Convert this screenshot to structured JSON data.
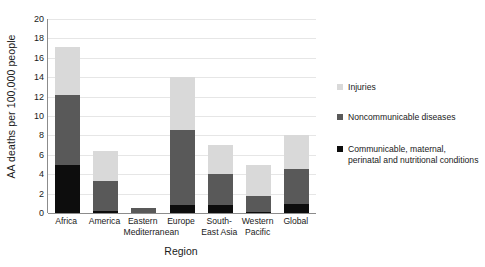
{
  "chart_data": {
    "type": "bar",
    "subtype": "stacked-bar",
    "title": "",
    "xlabel": "Region",
    "ylabel": "AA deaths per 100,000 people",
    "categories": [
      "Africa",
      "America",
      "Eastern Mediterranean",
      "Europe",
      "South-East Asia",
      "Western Pacific",
      "Global"
    ],
    "series": [
      {
        "name": "Communicable, maternal, perinatal and nutritional conditions",
        "color": "#0d0d0d",
        "values": [
          4.9,
          0.2,
          0.0,
          0.85,
          0.8,
          0.15,
          0.9
        ]
      },
      {
        "name": "Noncommunicable diseases",
        "color": "#595959",
        "values": [
          7.3,
          3.1,
          0.5,
          7.75,
          3.25,
          1.6,
          3.6
        ]
      },
      {
        "name": "Injuries",
        "color": "#d9d9d9",
        "values": [
          4.9,
          3.1,
          0.0,
          5.4,
          2.95,
          3.25,
          3.5
        ]
      }
    ],
    "totals": [
      17.1,
      6.4,
      0.5,
      14.0,
      7.0,
      5.0,
      8.0
    ],
    "ylim": [
      0,
      20
    ],
    "yticks": [
      0,
      2,
      4,
      6,
      8,
      10,
      12,
      14,
      16,
      18,
      20
    ],
    "ytick_labels": [
      "0",
      "2",
      "4",
      "6",
      "8",
      "10",
      "12",
      "14",
      "16",
      "18",
      "20"
    ],
    "grid": "horizontal",
    "legend_position": "right",
    "legend": [
      {
        "label": "Injuries",
        "color": "#d9d9d9"
      },
      {
        "label": "Noncommunicable diseases",
        "color": "#595959"
      },
      {
        "label": "Communicable, maternal,\nperinatal and nutritional conditions",
        "color": "#0d0d0d"
      }
    ]
  }
}
